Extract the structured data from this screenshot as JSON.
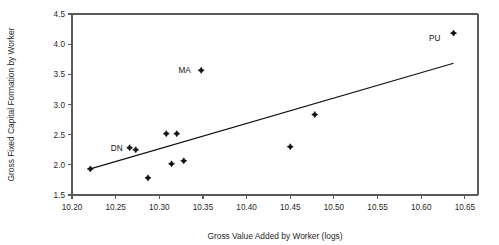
{
  "chart_data": {
    "type": "scatter",
    "title": "",
    "xlabel": "Gross Value Added by Worker (logs)",
    "ylabel": "Gross Fixed Capital Formation by Worker",
    "xlim": [
      10.2,
      10.665
    ],
    "ylim": [
      1.5,
      4.5
    ],
    "grid": false,
    "legend": "none",
    "xticks": [
      "10.20",
      "10.25",
      "10.30",
      "10.35",
      "10.40",
      "10.45",
      "10.50",
      "10.55",
      "10.60",
      "10.65"
    ],
    "xtick_values": [
      10.2,
      10.25,
      10.3,
      10.35,
      10.4,
      10.45,
      10.5,
      10.55,
      10.6,
      10.65
    ],
    "yticks": [
      "1.5",
      "2.0",
      "2.5",
      "3.0",
      "3.5",
      "4.0",
      "4.5"
    ],
    "ytick_values": [
      1.5,
      2.0,
      2.5,
      3.0,
      3.5,
      4.0,
      4.5
    ],
    "points": [
      {
        "x": 10.221,
        "y": 1.933,
        "label": ""
      },
      {
        "x": 10.266,
        "y": 2.283,
        "label": "DN"
      },
      {
        "x": 10.273,
        "y": 2.25,
        "label": ""
      },
      {
        "x": 10.287,
        "y": 1.783,
        "label": ""
      },
      {
        "x": 10.308,
        "y": 2.517,
        "label": ""
      },
      {
        "x": 10.32,
        "y": 2.517,
        "label": ""
      },
      {
        "x": 10.314,
        "y": 2.017,
        "label": ""
      },
      {
        "x": 10.328,
        "y": 2.067,
        "label": ""
      },
      {
        "x": 10.348,
        "y": 3.567,
        "label": "MA"
      },
      {
        "x": 10.45,
        "y": 2.3,
        "label": ""
      },
      {
        "x": 10.478,
        "y": 2.833,
        "label": ""
      },
      {
        "x": 10.637,
        "y": 4.183,
        "label": "PU"
      }
    ],
    "trend_line": {
      "x_start": 10.221,
      "y_start": 1.933,
      "x_end": 10.637,
      "y_end": 3.683
    },
    "annotations": [
      {
        "text": "DN",
        "x": 10.258,
        "y": 2.283
      },
      {
        "text": "MA",
        "x": 10.336,
        "y": 3.567
      },
      {
        "text": "PU",
        "x": 10.622,
        "y": 4.1
      }
    ]
  }
}
